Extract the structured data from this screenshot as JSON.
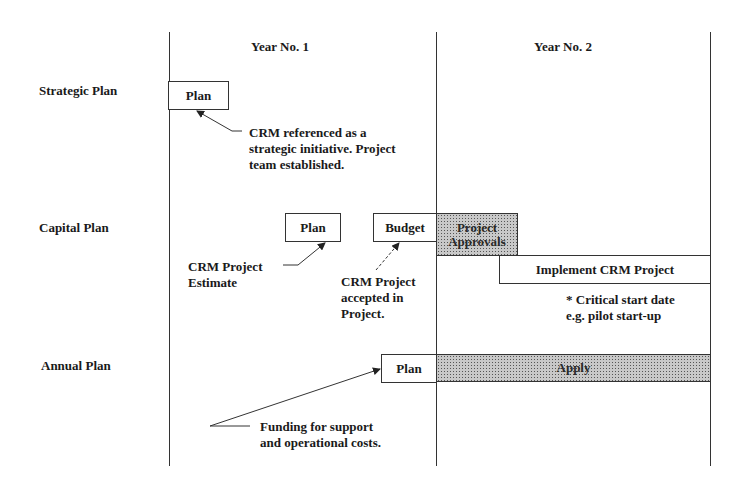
{
  "columns": [
    {
      "label": "Year No. 1"
    },
    {
      "label": "Year No. 2"
    }
  ],
  "rows": [
    {
      "label": "Strategic Plan"
    },
    {
      "label": "Capital Plan"
    },
    {
      "label": "Annual Plan"
    }
  ],
  "boxes": {
    "strategic_plan": {
      "label": "Plan"
    },
    "capital_plan": {
      "label": "Plan"
    },
    "capital_budget": {
      "label": "Budget"
    },
    "project_approvals": {
      "label": "Project Approvals",
      "line1": "Project",
      "line2": "Approvals"
    },
    "implement_crm": {
      "label": "Implement CRM Project"
    },
    "annual_plan": {
      "label": "Plan"
    },
    "apply": {
      "label": "Apply"
    }
  },
  "notes": {
    "strategic": [
      "CRM referenced as a",
      "strategic initiative.  Project",
      "team established."
    ],
    "estimate": [
      "CRM Project",
      "Estimate"
    ],
    "accepted": [
      "CRM Project",
      "accepted in",
      "Project."
    ],
    "critical": [
      "* Critical start date",
      "e.g. pilot start-up"
    ],
    "funding": [
      "Funding for support",
      "and operational costs."
    ]
  }
}
